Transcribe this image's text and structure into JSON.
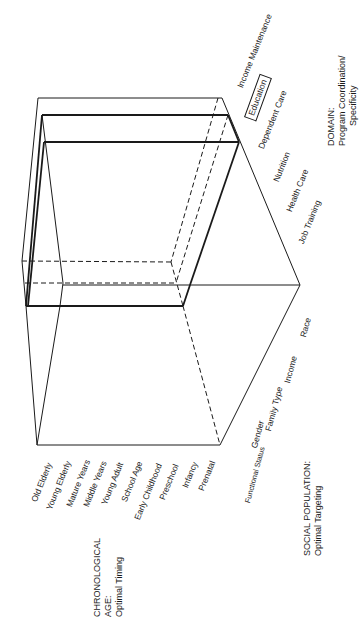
{
  "axes": {
    "chronological": {
      "title_line1": "CHRONOLOGICAL",
      "title_line2": "AGE:",
      "title_line3": "Optimal Timing",
      "labels": [
        "Old Elderly",
        "Young Elderly",
        "Mature Years",
        "Middle Years",
        "Young Adult",
        "School Age",
        "Early Childhood",
        "Preschool",
        "Infancy",
        "Prenatal"
      ]
    },
    "social_population": {
      "title_line1": "SOCIAL POPULATION:",
      "title_line2": "Optimal Targeting",
      "labels": [
        "Functional Status",
        "Gender",
        "Family Type",
        "Income",
        "Race"
      ]
    },
    "domain": {
      "title_line1": "DOMAIN:",
      "title_line2": "Program Coordination/",
      "title_line3": "Specificity",
      "labels": [
        "Income Maintenance",
        "Education",
        "Dependent Care",
        "Nutrition",
        "Health Care",
        "Job Training"
      ],
      "highlighted": "Education"
    }
  },
  "colors": {
    "line": "#1a1a1a",
    "background": "#ffffff"
  }
}
